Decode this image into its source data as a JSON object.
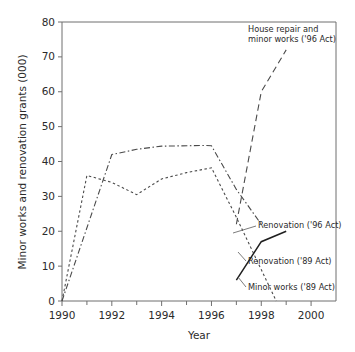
{
  "chart_data": {
    "type": "line",
    "title": "",
    "xlabel": "Year",
    "ylabel": "Minor works and renovation grants (000)",
    "xlim": [
      1990,
      2001
    ],
    "ylim": [
      0,
      80
    ],
    "xticks": [
      1990,
      1992,
      1994,
      1996,
      1998,
      2000
    ],
    "xticklabels": [
      "1990",
      "1992",
      "1994",
      "1996",
      "1998",
      "2000"
    ],
    "xminorticks": [
      1991,
      1993,
      1995,
      1997,
      1999
    ],
    "yticks": [
      0,
      10,
      20,
      30,
      40,
      50,
      60,
      70,
      80
    ],
    "yticklabels": [
      "0",
      "10",
      "20",
      "30",
      "40",
      "50",
      "60",
      "70",
      "80"
    ],
    "grid": false,
    "legend": "annotations",
    "series": [
      {
        "name": "Minor works ('89 Act)",
        "style": "dotted",
        "x": [
          1990,
          1991,
          1992,
          1993,
          1994,
          1995,
          1996,
          1997,
          1998,
          1998.6
        ],
        "values": [
          0,
          36,
          34,
          30.5,
          35,
          36.8,
          38.2,
          24,
          9,
          0
        ]
      },
      {
        "name": "Renovation ('89 Act)",
        "style": "dash-dot",
        "x": [
          1990,
          1992,
          1993,
          1994,
          1995.7,
          1996,
          1997,
          1998
        ],
        "values": [
          0,
          42,
          43.5,
          44.4,
          44.6,
          44.5,
          32,
          22
        ]
      },
      {
        "name": "House repair and minor works ('96 Act)",
        "style": "dashed",
        "x": [
          1997,
          1998,
          1999
        ],
        "values": [
          22,
          60,
          72
        ]
      },
      {
        "name": "Renovation ('96 Act)",
        "style": "solid",
        "x": [
          1997,
          1998,
          1999
        ],
        "values": [
          6,
          17,
          20
        ]
      }
    ],
    "annotations": [
      {
        "id": "house-repair",
        "lines": [
          "House repair and",
          "minor works ('96 Act)"
        ],
        "target_series": "House repair and minor works ('96 Act)"
      },
      {
        "id": "renovation-96",
        "lines": [
          "Renovation ('96 Act)"
        ],
        "target_series": "Renovation ('96 Act)"
      },
      {
        "id": "renovation-89",
        "lines": [
          "Renovation ('89 Act)"
        ],
        "target_series": "Renovation ('89 Act)"
      },
      {
        "id": "minor-works-89",
        "lines": [
          "Minor works ('89 Act)"
        ],
        "target_series": "Minor works ('89 Act)"
      }
    ]
  },
  "colors": {
    "axis": "#6f6f6f",
    "text": "#2b2b2b",
    "line": "#4a4a4a",
    "line_solid": "#1f1f1f",
    "background": "#ffffff"
  }
}
